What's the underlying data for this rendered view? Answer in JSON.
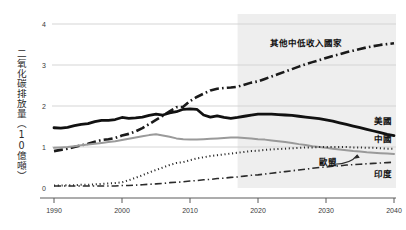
{
  "chart_data": {
    "type": "line",
    "title": "",
    "subtitle": "",
    "xlabel": "",
    "ylabel": "二氧化碳排放量（10億噸）",
    "xlim": [
      1990,
      2040
    ],
    "ylim": [
      0,
      4
    ],
    "x_ticks": [
      "1990",
      "2000",
      "2010",
      "2020",
      "2030",
      "2040"
    ],
    "x_tick_values": [
      1990,
      2000,
      2010,
      2020,
      2030,
      2040
    ],
    "y_ticks": [
      "0",
      "1",
      "2",
      "3",
      "4"
    ],
    "y_tick_values": [
      0,
      1,
      2,
      3,
      4
    ],
    "grid": "horizontal",
    "legend_position": "inline-right",
    "projection_start_year": 2017,
    "projection_shading_color": "#eeeeee",
    "x": [
      1990,
      1991,
      1992,
      1993,
      1994,
      1995,
      1996,
      1997,
      1998,
      1999,
      2000,
      2001,
      2002,
      2003,
      2004,
      2005,
      2006,
      2007,
      2008,
      2009,
      2010,
      2011,
      2012,
      2013,
      2014,
      2015,
      2016,
      2017,
      2018,
      2019,
      2020,
      2021,
      2022,
      2023,
      2024,
      2025,
      2026,
      2027,
      2028,
      2029,
      2030,
      2031,
      2032,
      2033,
      2034,
      2035,
      2036,
      2037,
      2038,
      2039,
      2040
    ],
    "series": [
      {
        "name": "其他中低收入國家",
        "label": "其他中低收入國家",
        "style": "dash-dot",
        "color": "#1a1a1a",
        "width": 2.6,
        "label_x": 2027,
        "label_y": 3.47,
        "values": [
          0.9,
          0.93,
          0.96,
          1.0,
          1.04,
          1.08,
          1.13,
          1.17,
          1.19,
          1.22,
          1.28,
          1.32,
          1.38,
          1.46,
          1.56,
          1.66,
          1.76,
          1.87,
          1.97,
          1.98,
          2.12,
          2.22,
          2.3,
          2.38,
          2.42,
          2.44,
          2.45,
          2.47,
          2.52,
          2.57,
          2.6,
          2.66,
          2.72,
          2.78,
          2.84,
          2.9,
          2.96,
          3.02,
          3.07,
          3.12,
          3.17,
          3.22,
          3.26,
          3.31,
          3.35,
          3.39,
          3.43,
          3.46,
          3.49,
          3.51,
          3.53
        ]
      },
      {
        "name": "美國",
        "label": "美國",
        "style": "solid",
        "color": "#111111",
        "width": 2.8,
        "label_x": 2037,
        "label_y": 1.55,
        "values": [
          1.47,
          1.46,
          1.48,
          1.52,
          1.55,
          1.57,
          1.62,
          1.65,
          1.65,
          1.67,
          1.72,
          1.7,
          1.71,
          1.73,
          1.77,
          1.8,
          1.78,
          1.83,
          1.86,
          1.92,
          1.93,
          1.92,
          1.78,
          1.73,
          1.76,
          1.72,
          1.7,
          1.72,
          1.75,
          1.78,
          1.8,
          1.8,
          1.8,
          1.79,
          1.78,
          1.77,
          1.75,
          1.73,
          1.71,
          1.69,
          1.66,
          1.63,
          1.59,
          1.55,
          1.51,
          1.47,
          1.43,
          1.39,
          1.35,
          1.31,
          1.28
        ]
      },
      {
        "name": "中國",
        "label": "中國",
        "style": "solid",
        "color": "#9a9a9a",
        "width": 2.0,
        "label_x": 2037,
        "label_y": 1.12,
        "values": [
          0.98,
          0.99,
          1.0,
          1.02,
          1.04,
          1.06,
          1.08,
          1.1,
          1.12,
          1.14,
          1.17,
          1.2,
          1.23,
          1.26,
          1.29,
          1.31,
          1.28,
          1.25,
          1.21,
          1.19,
          1.18,
          1.18,
          1.19,
          1.2,
          1.21,
          1.22,
          1.23,
          1.23,
          1.22,
          1.21,
          1.19,
          1.18,
          1.16,
          1.14,
          1.12,
          1.1,
          1.07,
          1.05,
          1.02,
          1.0,
          0.98,
          0.96,
          0.94,
          0.92,
          0.9,
          0.89,
          0.87,
          0.86,
          0.85,
          0.84,
          0.83
        ]
      },
      {
        "name": "歐盟",
        "label": "歐盟",
        "style": "dotted",
        "color": "#2b2b2b",
        "width": 2.0,
        "label_x": 2029,
        "label_y": 0.55,
        "values": [
          0.06,
          0.06,
          0.07,
          0.07,
          0.08,
          0.08,
          0.09,
          0.1,
          0.11,
          0.12,
          0.14,
          0.19,
          0.25,
          0.31,
          0.38,
          0.44,
          0.5,
          0.56,
          0.61,
          0.63,
          0.68,
          0.72,
          0.75,
          0.78,
          0.8,
          0.82,
          0.84,
          0.86,
          0.88,
          0.9,
          0.91,
          0.93,
          0.94,
          0.95,
          0.96,
          0.97,
          0.98,
          0.99,
          0.99,
          1.0,
          1.0,
          1.0,
          1.0,
          1.0,
          0.99,
          0.99,
          0.98,
          0.98,
          0.97,
          0.96,
          0.96
        ]
      },
      {
        "name": "印度",
        "label": "印度",
        "style": "dash-dot-thin",
        "color": "#2b2b2b",
        "width": 1.6,
        "label_x": 2037,
        "label_y": 0.28,
        "values": [
          0.05,
          0.05,
          0.05,
          0.05,
          0.05,
          0.05,
          0.05,
          0.05,
          0.05,
          0.05,
          0.06,
          0.06,
          0.07,
          0.08,
          0.09,
          0.1,
          0.11,
          0.13,
          0.14,
          0.15,
          0.17,
          0.18,
          0.2,
          0.21,
          0.23,
          0.24,
          0.26,
          0.27,
          0.29,
          0.31,
          0.32,
          0.34,
          0.36,
          0.38,
          0.4,
          0.42,
          0.44,
          0.46,
          0.48,
          0.5,
          0.51,
          0.53,
          0.54,
          0.56,
          0.57,
          0.58,
          0.59,
          0.6,
          0.61,
          0.62,
          0.63
        ]
      }
    ],
    "annotations": [
      {
        "name": "eu-pointer-arrow",
        "from_label": "歐盟",
        "points_to": "歐盟 line"
      }
    ]
  }
}
